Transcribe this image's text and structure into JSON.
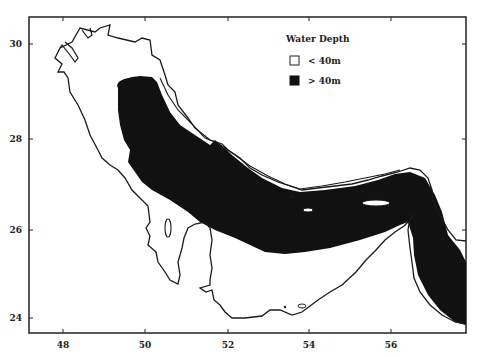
{
  "map": {
    "region": "Persian Gulf",
    "legend": {
      "title": "Water Depth",
      "items": [
        {
          "label": "< 40m",
          "fill": "#ffffff"
        },
        {
          "label": "> 40m",
          "fill": "#111111"
        }
      ]
    },
    "x_axis": {
      "ticks": [
        "48",
        "50",
        "52",
        "54",
        "56"
      ],
      "tick_px": [
        63,
        145,
        228,
        309,
        391
      ]
    },
    "y_axis": {
      "ticks": [
        "30",
        "28",
        "26",
        "24"
      ],
      "tick_px": [
        44,
        139,
        230,
        318
      ]
    },
    "colors": {
      "coastline": "#1a1a1a",
      "deep_water": "#111111",
      "background": "#ffffff"
    }
  }
}
